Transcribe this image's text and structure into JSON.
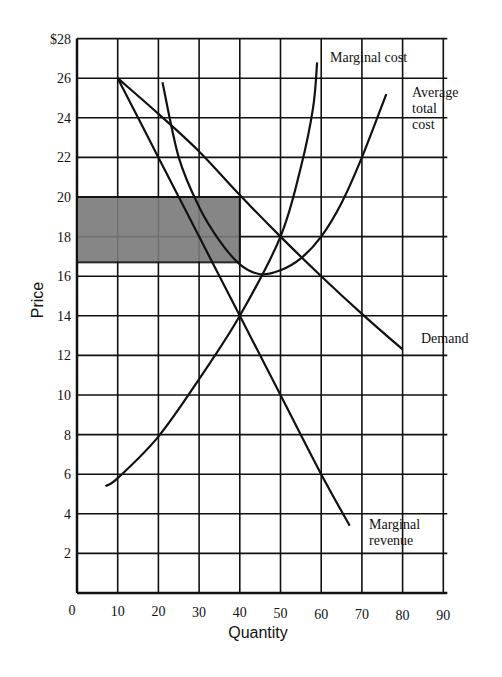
{
  "chart_data": {
    "type": "line",
    "title": "",
    "xlabel": "Quantity",
    "ylabel": "Price",
    "xlim": [
      0,
      90
    ],
    "ylim": [
      0,
      28
    ],
    "grid": true,
    "x_ticks": [
      "0",
      "10",
      "20",
      "30",
      "40",
      "50",
      "60",
      "70",
      "80",
      "90"
    ],
    "y_ticks": [
      "2",
      "4",
      "6",
      "8",
      "10",
      "12",
      "14",
      "16",
      "18",
      "20",
      "22",
      "24",
      "26",
      "$28"
    ],
    "shaded_region": {
      "x": [
        0,
        40
      ],
      "y": [
        16.7,
        20
      ],
      "meaning": "profit rectangle"
    },
    "series": [
      {
        "name": "Demand",
        "points": [
          [
            10,
            26
          ],
          [
            20,
            24.2
          ],
          [
            30,
            22.3
          ],
          [
            40,
            20.1
          ],
          [
            50,
            18
          ],
          [
            60,
            16
          ],
          [
            70,
            14.1
          ],
          [
            80,
            12.3
          ]
        ]
      },
      {
        "name": "Marginal revenue",
        "points": [
          [
            10,
            26
          ],
          [
            20,
            22
          ],
          [
            30,
            18
          ],
          [
            40,
            14
          ],
          [
            50,
            10
          ],
          [
            60,
            6
          ],
          [
            67,
            3.4
          ]
        ]
      },
      {
        "name": "Marginal cost",
        "points": [
          [
            7,
            5.4
          ],
          [
            10,
            5.8
          ],
          [
            20,
            7.9
          ],
          [
            30,
            10.8
          ],
          [
            40,
            14
          ],
          [
            50,
            18
          ],
          [
            55,
            21.5
          ],
          [
            58,
            24.5
          ],
          [
            59,
            26.8
          ]
        ]
      },
      {
        "name": "Average total cost",
        "points": [
          [
            21,
            25.8
          ],
          [
            25,
            22
          ],
          [
            30,
            19.5
          ],
          [
            35,
            17.8
          ],
          [
            40,
            16.6
          ],
          [
            45,
            16.1
          ],
          [
            50,
            16.3
          ],
          [
            55,
            16.9
          ],
          [
            60,
            18
          ],
          [
            65,
            19.7
          ],
          [
            70,
            22
          ],
          [
            76,
            25.2
          ]
        ]
      }
    ],
    "annotations": [
      "Marginal cost",
      "Average total cost",
      "Demand",
      "Marginal revenue"
    ]
  },
  "labels": {
    "marginal_cost": "Marginal cost",
    "atc_1": "Average",
    "atc_2": "total",
    "atc_3": "cost",
    "demand": "Demand",
    "mr_1": "Marginal",
    "mr_2": "revenue",
    "xlabel": "Quantity",
    "ylabel": "Price"
  }
}
